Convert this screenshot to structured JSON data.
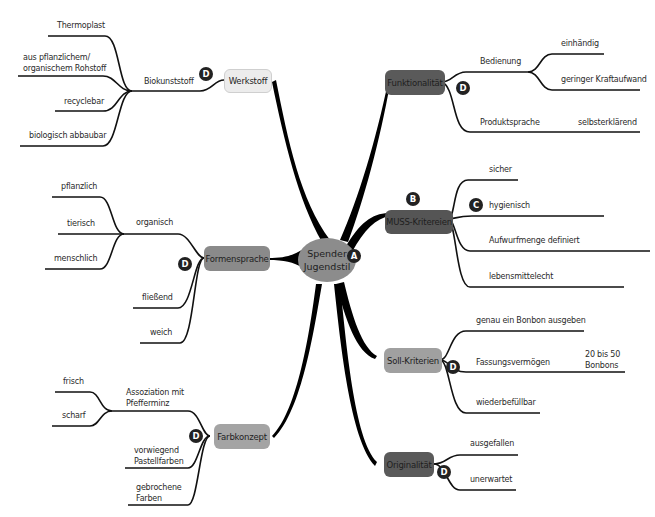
{
  "center": {
    "line1": "Spender",
    "line2": "Jugendstil",
    "badge": "A"
  },
  "branches": {
    "werkstoff": {
      "label": "Werkstoff",
      "color": "#ececec",
      "badge": "D",
      "sub": {
        "label": "Biokunststoff",
        "leaves": [
          "Thermoplast",
          "aus pflanzlichem/",
          "organischem Rohstoff",
          "recyclebar",
          "biologisch abbaubar"
        ]
      }
    },
    "funktionalitaet": {
      "label": "Funktionalität",
      "color": "#5a5a5a",
      "badge": "D",
      "subs": [
        {
          "label": "Bedienung",
          "leaves": [
            "einhändig",
            "geringer Kraftaufwand"
          ]
        },
        {
          "label": "Produktsprache",
          "leaves": [
            "selbsterklärend"
          ]
        }
      ]
    },
    "muss": {
      "label": "MUSS-Kritereien",
      "color": "#555555",
      "badge": "B",
      "leaf_badge": "C",
      "leaves": [
        "sicher",
        "hygienisch",
        "Aufwurfmenge definiert",
        "lebensmittelecht"
      ]
    },
    "formensprache": {
      "label": "Formensprache",
      "color": "#8a8a8a",
      "badge": "D",
      "sub": {
        "label": "organisch",
        "leaves": [
          "pflanzlich",
          "tierisch",
          "menschlich"
        ]
      },
      "leaves": [
        "fließend",
        "weich"
      ]
    },
    "soll": {
      "label": "Soll-Kriterien",
      "color": "#a0a0a0",
      "badge": "D",
      "leaves": [
        "genau ein Bonbon ausgeben",
        "Fassungsvermögen",
        "wiederbefüllbar"
      ],
      "capacity": {
        "line1": "20 bis 50",
        "line2": "Bonbons"
      }
    },
    "farbkonzept": {
      "label": "Farbkonzept",
      "color": "#a4a4a4",
      "badge": "D",
      "sub": {
        "label1": "Assoziation mit",
        "label2": "Pfefferminz",
        "leaves": [
          "frisch",
          "scharf"
        ]
      },
      "leaves": [
        {
          "line1": "vorwiegend",
          "line2": "Pastellfarben"
        },
        {
          "line1": "gebrochene",
          "line2": "Farben"
        }
      ]
    },
    "originalitaet": {
      "label": "Originalität",
      "color": "#5a5a5a",
      "badge": "D",
      "leaves": [
        "ausgefallen",
        "unerwartet"
      ]
    }
  }
}
